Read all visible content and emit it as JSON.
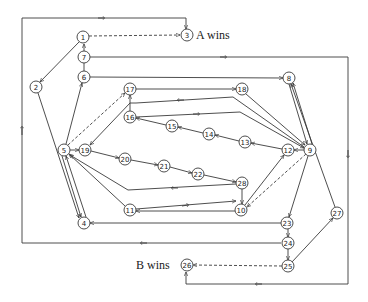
{
  "diagram": {
    "type": "game-state-graph",
    "labels": {
      "a_wins": "A wins",
      "b_wins": "B wins"
    },
    "nodes": [
      {
        "id": "1",
        "x": 83,
        "y": 37
      },
      {
        "id": "2",
        "x": 36,
        "y": 87
      },
      {
        "id": "3",
        "x": 187,
        "y": 35
      },
      {
        "id": "4",
        "x": 84,
        "y": 223
      },
      {
        "id": "5",
        "x": 64,
        "y": 150
      },
      {
        "id": "6",
        "x": 84,
        "y": 77
      },
      {
        "id": "7",
        "x": 84,
        "y": 57
      },
      {
        "id": "8",
        "x": 289,
        "y": 78
      },
      {
        "id": "9",
        "x": 310,
        "y": 150
      },
      {
        "id": "10",
        "x": 241,
        "y": 210
      },
      {
        "id": "11",
        "x": 130,
        "y": 210
      },
      {
        "id": "12",
        "x": 288,
        "y": 150
      },
      {
        "id": "13",
        "x": 245,
        "y": 142
      },
      {
        "id": "14",
        "x": 209,
        "y": 134
      },
      {
        "id": "15",
        "x": 172,
        "y": 126
      },
      {
        "id": "16",
        "x": 130,
        "y": 117
      },
      {
        "id": "17",
        "x": 130,
        "y": 89
      },
      {
        "id": "18",
        "x": 242,
        "y": 89
      },
      {
        "id": "19",
        "x": 85,
        "y": 150
      },
      {
        "id": "20",
        "x": 125,
        "y": 159
      },
      {
        "id": "21",
        "x": 164,
        "y": 166
      },
      {
        "id": "22",
        "x": 198,
        "y": 174
      },
      {
        "id": "23",
        "x": 287,
        "y": 223
      },
      {
        "id": "24",
        "x": 288,
        "y": 243
      },
      {
        "id": "25",
        "x": 288,
        "y": 266
      },
      {
        "id": "26",
        "x": 187,
        "y": 265
      },
      {
        "id": "27",
        "x": 337,
        "y": 213
      },
      {
        "id": "28",
        "x": 242,
        "y": 183
      }
    ],
    "edges": [
      {
        "from": "1",
        "to": "3",
        "style": "dashed"
      },
      {
        "from": "1",
        "to": "2",
        "style": "solid"
      },
      {
        "from": "7",
        "to": "1",
        "style": "solid"
      },
      {
        "from": "6",
        "to": "7",
        "style": "solid"
      },
      {
        "from": "5",
        "to": "6",
        "style": "solid"
      },
      {
        "from": "2",
        "to": "4",
        "style": "solid"
      },
      {
        "from": "4",
        "to": "5",
        "style": "solid"
      },
      {
        "from": "5",
        "to": "4",
        "style": "solid"
      },
      {
        "from": "5",
        "to": "19",
        "style": "solid"
      },
      {
        "from": "5",
        "to": "17",
        "style": "dashed"
      },
      {
        "from": "16",
        "to": "17",
        "style": "solid"
      },
      {
        "from": "17",
        "to": "19",
        "style": "solid"
      },
      {
        "from": "19",
        "to": "20",
        "style": "solid"
      },
      {
        "from": "20",
        "to": "21",
        "style": "solid"
      },
      {
        "from": "21",
        "to": "22",
        "style": "solid"
      },
      {
        "from": "22",
        "to": "28",
        "style": "solid"
      },
      {
        "from": "28",
        "to": "10",
        "style": "solid"
      },
      {
        "from": "10",
        "to": "12",
        "style": "solid"
      },
      {
        "from": "9",
        "to": "10",
        "style": "dashed"
      },
      {
        "from": "9",
        "to": "12",
        "style": "solid"
      },
      {
        "from": "12",
        "to": "13",
        "style": "solid"
      },
      {
        "from": "13",
        "to": "14",
        "style": "solid"
      },
      {
        "from": "14",
        "to": "15",
        "style": "solid"
      },
      {
        "from": "15",
        "to": "16",
        "style": "solid"
      },
      {
        "from": "16",
        "to": "9",
        "style": "solid"
      },
      {
        "from": "9",
        "to": "17",
        "style": "solid"
      },
      {
        "from": "17",
        "to": "18",
        "style": "solid"
      },
      {
        "from": "18",
        "to": "9",
        "style": "solid"
      },
      {
        "from": "6",
        "to": "8",
        "style": "solid"
      },
      {
        "from": "8",
        "to": "9",
        "style": "solid"
      },
      {
        "from": "9",
        "to": "8",
        "style": "solid"
      },
      {
        "from": "9",
        "to": "23",
        "style": "solid"
      },
      {
        "from": "9",
        "to": "5",
        "style": "solid"
      },
      {
        "from": "11",
        "to": "5",
        "style": "solid"
      },
      {
        "from": "11",
        "to": "9",
        "style": "solid"
      },
      {
        "from": "10",
        "to": "11",
        "style": "solid"
      },
      {
        "from": "23",
        "to": "4",
        "style": "solid"
      },
      {
        "from": "23",
        "to": "24",
        "style": "solid"
      },
      {
        "from": "24",
        "to": "25",
        "style": "solid"
      },
      {
        "from": "24",
        "to": "2",
        "style": "solid"
      },
      {
        "from": "25",
        "to": "26",
        "style": "dashed"
      },
      {
        "from": "25",
        "to": "27",
        "style": "solid"
      },
      {
        "from": "27",
        "to": "8",
        "style": "solid"
      },
      {
        "from": "7",
        "to": "26",
        "style": "solid"
      },
      {
        "from": "2",
        "to": "3",
        "style": "solid"
      }
    ]
  }
}
